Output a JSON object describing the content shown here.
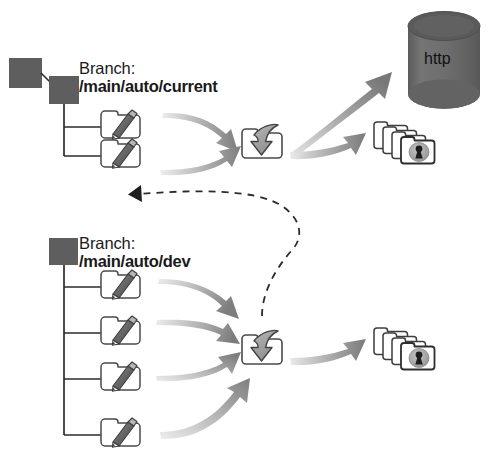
{
  "diagram": {
    "background_color": "#ffffff",
    "colors": {
      "node_square": "#5e5e5e",
      "cylinder": "#6b6b6b",
      "cylinder_top": "#5a5a5a",
      "arrow_head": "#7d7d7d",
      "arrow_tail": "#dcdcdc",
      "line": "#2b2b2b",
      "icon_outline": "#3f3f3f",
      "icon_fill": "#ffffff",
      "pencil": "#6e6e6e",
      "lock": "#9a9a9a",
      "text": "#1a1a1a"
    }
  },
  "branches": [
    {
      "id": "current",
      "title": "Branch:",
      "path": "/main/auto/current",
      "elements": 2
    },
    {
      "id": "dev",
      "title": "Branch:",
      "path": "/main/auto/dev",
      "elements": 4
    }
  ],
  "nodes": {
    "parent_square": "parent-branch-node",
    "current_square": "current-branch-node",
    "dev_square": "dev-branch-node"
  },
  "targets": {
    "server": {
      "label": "http",
      "shape": "cylinder",
      "name": "http-server-cylinder"
    },
    "import_tray_top": {
      "name": "import-tray-icon",
      "description": "folder with down arrow"
    },
    "import_tray_bottom": {
      "name": "import-tray-icon",
      "description": "folder with down arrow"
    },
    "secure_folders_top": {
      "name": "secure-folder-stack-icon",
      "count": 4,
      "description": "stacked folders with keyhole lock"
    },
    "secure_folders_bottom": {
      "name": "secure-folder-stack-icon",
      "count": 4,
      "description": "stacked folders with keyhole lock"
    }
  },
  "connections": {
    "dashed_feedback": {
      "style": "dashed",
      "from": "import-tray-bottom",
      "to": "current-branch-element-2"
    }
  },
  "caption": {
    "text": ""
  }
}
